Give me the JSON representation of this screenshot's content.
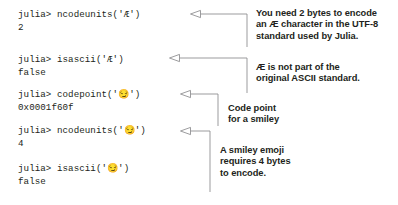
{
  "figure": {
    "background": "#ffffff",
    "text_color": "#231f20",
    "leader_color": "#8a8a8d"
  },
  "repl": {
    "prompt": "julia> ",
    "blocks": [
      {
        "id": "block-ncodeunits-ae",
        "input": "julia> ncodeunits('Æ')",
        "command": "ncodeunits('Æ')",
        "output": "2"
      },
      {
        "id": "block-isascii-ae",
        "input": "julia> isascii('Æ')",
        "command": "isascii('Æ')",
        "output": "false"
      },
      {
        "id": "block-codepoint-emoji",
        "input": "julia> codepoint('😏')",
        "command": "codepoint('😏')",
        "output": "0x0001f60f"
      },
      {
        "id": "block-ncodeunits-emoji",
        "input": "julia> ncodeunits('😏')",
        "command": "ncodeunits('😏')",
        "output": "4"
      },
      {
        "id": "block-isascii-emoji",
        "input": "julia> isascii('😏')",
        "command": "isascii('😏')",
        "output": "false"
      }
    ]
  },
  "annotations": [
    {
      "id": "annotation-utf8-bytes",
      "lines": [
        "You need 2 bytes to encode",
        "an Æ character in the UTF-8",
        "standard used by Julia."
      ]
    },
    {
      "id": "annotation-ascii-standard",
      "lines": [
        "Æ is not part of the",
        "original ASCII standard."
      ]
    },
    {
      "id": "annotation-code-point",
      "lines": [
        "Code point",
        "for a smiley"
      ]
    },
    {
      "id": "annotation-emoji-bytes",
      "lines": [
        "A smiley emoji",
        "requires 4 bytes",
        "to encode."
      ]
    }
  ]
}
